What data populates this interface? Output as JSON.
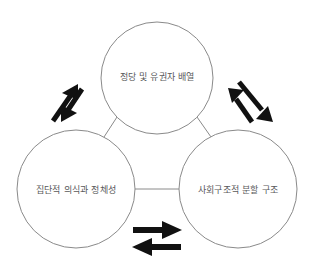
{
  "diagram": {
    "type": "cycle-triad",
    "background_color": "#ffffff",
    "circle_stroke_color": "#8a8a8a",
    "label_color": "#58585a",
    "arrow_color": "#111111",
    "nodes": [
      {
        "id": "party-voter-alignment",
        "label": "정당 및 유권자 배열",
        "position": "top",
        "cx": 157,
        "cy": 78,
        "r": 56
      },
      {
        "id": "collective-consciousness-identity",
        "label": "집단적 의식과 정체성",
        "position": "bottom-left",
        "cx": 76,
        "cy": 189,
        "r": 59
      },
      {
        "id": "social-structural-cleavage",
        "label": "사회구조적 분할 구조",
        "position": "bottom-right",
        "cx": 238,
        "cy": 189,
        "r": 59
      }
    ],
    "connectors": [
      {
        "id": "connector-top-left",
        "from": "party-voter-alignment",
        "to": "collective-consciousness-identity"
      },
      {
        "id": "connector-top-right",
        "from": "party-voter-alignment",
        "to": "social-structural-cleavage"
      },
      {
        "id": "connector-bottom",
        "from": "collective-consciousness-identity",
        "to": "social-structural-cleavage"
      }
    ],
    "arrow_pairs": [
      {
        "id": "arrows-left",
        "between": [
          "collective-consciousness-identity",
          "party-voter-alignment"
        ],
        "direction": "bidirectional",
        "orientation": "diagonal-up-right"
      },
      {
        "id": "arrows-right",
        "between": [
          "party-voter-alignment",
          "social-structural-cleavage"
        ],
        "direction": "bidirectional",
        "orientation": "diagonal-down-right"
      },
      {
        "id": "arrows-bottom",
        "between": [
          "collective-consciousness-identity",
          "social-structural-cleavage"
        ],
        "direction": "bidirectional",
        "orientation": "horizontal"
      }
    ]
  }
}
